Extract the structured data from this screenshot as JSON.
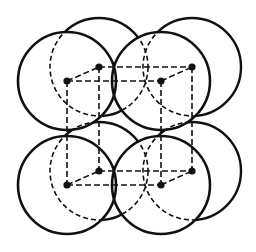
{
  "diagram": {
    "title": "",
    "colors": {
      "stroke": "#111111",
      "background": "#ffffff"
    },
    "radius": 49,
    "front_centers": [
      {
        "id": "front-top-left",
        "x": 67,
        "y": 81
      },
      {
        "id": "front-top-right",
        "x": 161,
        "y": 81
      },
      {
        "id": "front-bottom-left",
        "x": 67,
        "y": 185
      },
      {
        "id": "front-bottom-right",
        "x": 161,
        "y": 185
      }
    ],
    "back_centers": [
      {
        "id": "back-top-left",
        "x": 99,
        "y": 67
      },
      {
        "id": "back-top-right",
        "x": 192,
        "y": 67
      },
      {
        "id": "back-bottom-left",
        "x": 99,
        "y": 171
      },
      {
        "id": "back-bottom-right",
        "x": 192,
        "y": 171
      }
    ],
    "labels": []
  }
}
